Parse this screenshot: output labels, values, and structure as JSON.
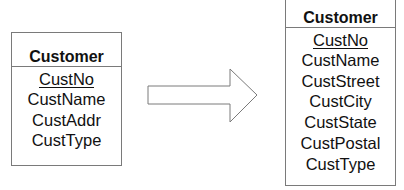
{
  "left_entity": {
    "title": "Customer",
    "attributes": [
      {
        "name": "CustNo",
        "primary_key": true
      },
      {
        "name": "CustName",
        "primary_key": false
      },
      {
        "name": "CustAddr",
        "primary_key": false
      },
      {
        "name": "CustType",
        "primary_key": false
      }
    ]
  },
  "right_entity": {
    "title": "Customer",
    "attributes": [
      {
        "name": "CustNo",
        "primary_key": true
      },
      {
        "name": "CustName",
        "primary_key": false
      },
      {
        "name": "CustStreet",
        "primary_key": false
      },
      {
        "name": "CustCity",
        "primary_key": false
      },
      {
        "name": "CustState",
        "primary_key": false
      },
      {
        "name": "CustPostal",
        "primary_key": false
      },
      {
        "name": "CustType",
        "primary_key": false
      }
    ]
  },
  "arrow": {
    "direction": "right",
    "stroke_color": "#7a7a7a",
    "fill_color": "#ffffff"
  }
}
